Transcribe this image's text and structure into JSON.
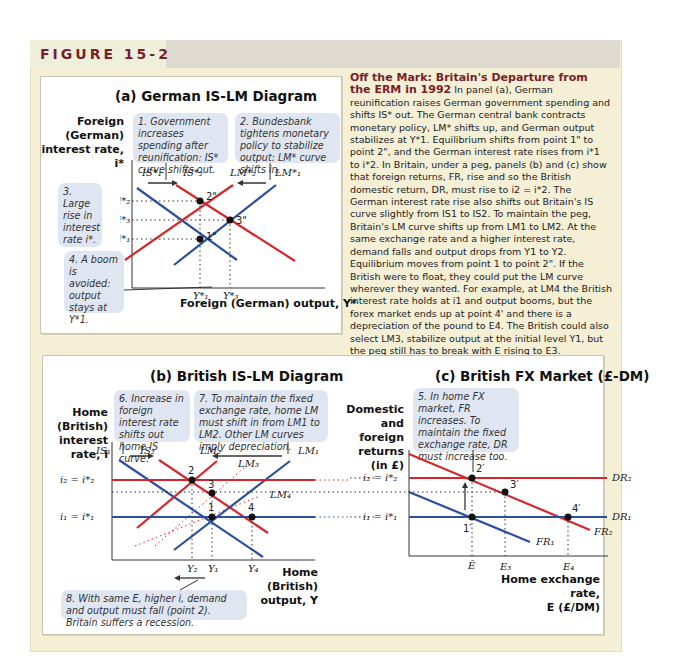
{
  "figure": {
    "label": "FIGURE 15-2",
    "colors": {
      "accent": "#7a1e2a",
      "red_curve": "#d6262b",
      "blue_curve": "#2b4e9f",
      "note_bg": "#dfe6f2",
      "frame_bg": "#f5efd6"
    }
  },
  "panel_a": {
    "title": "(a) German IS-LM Diagram",
    "y_axis_label": [
      "Foreign",
      "(German)",
      "interest rate,",
      "i*"
    ],
    "x_axis_label": "Foreign (German) output, Y*",
    "notes": [
      "1. Government increases spending after reunification: IS* curve shifts out.",
      "2. Bundesbank tightens monetary policy to stabilize output: LM* curve shifts in.",
      "3. Large rise in interest rate i*.",
      "4. A boom is avoided: output stays at Y*1."
    ],
    "curves": [
      "IS*1",
      "IS*2",
      "LM*2",
      "LM*1"
    ],
    "y_ticks": [
      "i*2",
      "i*3",
      "i*1"
    ],
    "x_ticks": [
      "Y*1",
      "Y*3"
    ],
    "points": [
      "1\"",
      "2\"",
      "3\""
    ]
  },
  "description": {
    "heading": "Off the Mark: Britain's Departure from the ERM in 1992",
    "body": "In panel (a), German reunification raises German government spending and shifts IS* out. The German central bank contracts monetary policy, LM* shifts up, and German output stabilizes at Y*1. Equilibrium shifts from point 1\" to point 2\", and the German interest rate rises from i*1 to i*2. In Britain, under a peg, panels (b) and (c) show that foreign returns, FR, rise and so the British domestic return, DR, must rise to i2 = i*2. The German interest rate rise also shifts out Britain's IS curve slightly from IS1 to IS2. To maintain the peg, Britain's LM curve shifts up from LM1 to LM2. At the same exchange rate and a higher interest rate, demand falls and output drops from Y1 to Y2. Equilibrium moves from point 1 to point 2\". If the British were to float, they could put the LM curve wherever they wanted. For example, at LM4 the British interest rate holds at i1 and output booms, but the forex market ends up at point 4' and there is a depreciation of the pound to E4. The British could also select LM3, stabilize output at the initial level Y1, but the peg still has to break with E rising to E3."
  },
  "panel_b": {
    "title": "(b) British IS-LM Diagram",
    "y_axis_label": [
      "Home",
      "(British)",
      "interest",
      "rate, i"
    ],
    "x_axis_label": [
      "Home (British)",
      "output, Y"
    ],
    "notes": [
      "6. Increase in foreign interest rate shifts out home IS curve.",
      "7. To maintain the fixed exchange rate, home LM must shift in from LM1 to LM2. Other LM curves imply depreciation.",
      "8. With same E, higher i, demand and output must fall (point 2). Britain suffers a recession."
    ],
    "curves": [
      "IS1",
      "IS2",
      "LM2",
      "LM3",
      "LM4",
      "LM1"
    ],
    "y_ticks": [
      "i2 = i*2",
      "i1 = i*1"
    ],
    "x_ticks": [
      "Y2",
      "Y1",
      "Y4"
    ],
    "points": [
      "1",
      "2",
      "3",
      "4"
    ]
  },
  "panel_c": {
    "title": "(c) British FX Market (£-DM)",
    "y_axis_label": [
      "Domestic",
      "and foreign",
      "returns",
      "(in £)"
    ],
    "x_axis_label": [
      "Home exchange rate,",
      "E (£/DM)"
    ],
    "notes": [
      "5. In home FX market, FR increases. To maintain the fixed exchange rate, DR must increase too."
    ],
    "curves": [
      "DR2",
      "DR1",
      "FR1",
      "FR2"
    ],
    "y_ticks": [
      "i2 = i*2",
      "i1 = i*1"
    ],
    "x_ticks": [
      "Ē",
      "E3",
      "E4"
    ],
    "points": [
      "1'",
      "2'",
      "3'",
      "4'"
    ]
  }
}
